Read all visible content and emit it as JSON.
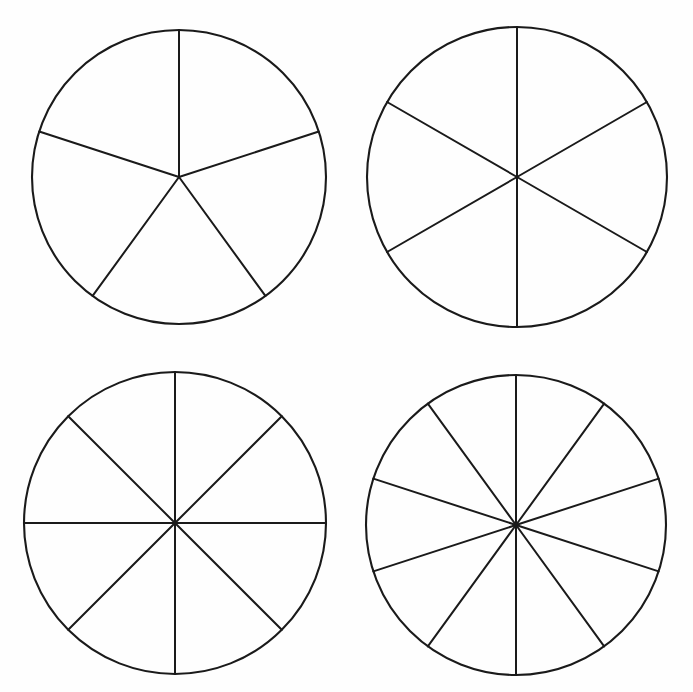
{
  "page": {
    "background_color": "#fefefe",
    "line_color": "#1a1a1a",
    "width": 693,
    "height": 692
  },
  "chart_data": {
    "type": "pie",
    "subtitle": "",
    "xlabel": "",
    "ylabel": "",
    "grid": false,
    "legend": "none",
    "figures": [
      {
        "id": "circle-1",
        "position": "top-left",
        "center_x": 179,
        "center_y": 177,
        "radius": 147,
        "slices": 5,
        "slice_angle_degrees": 72,
        "fraction_per_slice": "1/5",
        "start_angle_degrees": 0,
        "radii_angles_from_top_degrees": [
          0,
          72,
          144,
          216,
          288
        ],
        "values": [
          20,
          20,
          20,
          20,
          20
        ],
        "categories": [
          "1/5",
          "1/5",
          "1/5",
          "1/5",
          "1/5"
        ],
        "fill": "none",
        "stroke": "#1a1a1a"
      },
      {
        "id": "circle-2",
        "position": "top-right",
        "center_x": 517,
        "center_y": 177,
        "radius": 150,
        "slices": 6,
        "slice_angle_degrees": 60,
        "fraction_per_slice": "1/6",
        "start_angle_degrees": 0,
        "radii_angles_from_top_degrees": [
          0,
          60,
          120,
          180,
          240,
          300
        ],
        "values": [
          16.67,
          16.67,
          16.67,
          16.67,
          16.67,
          16.67
        ],
        "categories": [
          "1/6",
          "1/6",
          "1/6",
          "1/6",
          "1/6",
          "1/6"
        ],
        "fill": "none",
        "stroke": "#1a1a1a"
      },
      {
        "id": "circle-3",
        "position": "bottom-left",
        "center_x": 175,
        "center_y": 523,
        "radius": 151,
        "slices": 8,
        "slice_angle_degrees": 45,
        "fraction_per_slice": "1/8",
        "start_angle_degrees": 0,
        "radii_angles_from_top_degrees": [
          0,
          45,
          90,
          135,
          180,
          225,
          270,
          315
        ],
        "values": [
          12.5,
          12.5,
          12.5,
          12.5,
          12.5,
          12.5,
          12.5,
          12.5
        ],
        "categories": [
          "1/8",
          "1/8",
          "1/8",
          "1/8",
          "1/8",
          "1/8",
          "1/8",
          "1/8"
        ],
        "fill": "none",
        "stroke": "#1a1a1a"
      },
      {
        "id": "circle-4",
        "position": "bottom-right",
        "center_x": 516,
        "center_y": 525,
        "radius": 150,
        "slices": 10,
        "slice_angle_degrees": 36,
        "fraction_per_slice": "1/10",
        "start_angle_degrees": 0,
        "radii_angles_from_top_degrees": [
          0,
          36,
          72,
          108,
          144,
          180,
          216,
          252,
          288,
          324
        ],
        "values": [
          10,
          10,
          10,
          10,
          10,
          10,
          10,
          10,
          10,
          10
        ],
        "categories": [
          "1/10",
          "1/10",
          "1/10",
          "1/10",
          "1/10",
          "1/10",
          "1/10",
          "1/10",
          "1/10",
          "1/10"
        ],
        "fill": "none",
        "stroke": "#1a1a1a"
      }
    ]
  }
}
